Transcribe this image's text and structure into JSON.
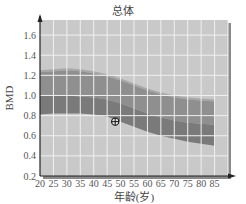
{
  "chart_data": {
    "type": "area",
    "title": "总体",
    "xlabel": "年龄(岁)",
    "ylabel": "BMD",
    "x_ticks": [
      20,
      25,
      30,
      35,
      40,
      45,
      50,
      55,
      60,
      65,
      70,
      75,
      80,
      85
    ],
    "y_ticks": [
      0.2,
      0.4,
      0.6,
      0.8,
      1.0,
      1.2,
      1.4,
      1.6
    ],
    "xlim": [
      20,
      90
    ],
    "ylim": [
      0.2,
      1.75
    ],
    "grid": true,
    "x": [
      20,
      25,
      30,
      35,
      40,
      45,
      50,
      55,
      60,
      65,
      70,
      75,
      80,
      85
    ],
    "series": [
      {
        "name": "upper band top (+2SD)",
        "values": [
          1.23,
          1.24,
          1.25,
          1.24,
          1.22,
          1.19,
          1.15,
          1.1,
          1.05,
          1.01,
          0.98,
          0.96,
          0.95,
          0.94
        ]
      },
      {
        "name": "reference mean",
        "values": [
          1.0,
          1.0,
          1.0,
          0.99,
          0.98,
          0.96,
          0.92,
          0.87,
          0.82,
          0.78,
          0.75,
          0.73,
          0.72,
          0.71
        ]
      },
      {
        "name": "lower band bottom (-2SD)",
        "values": [
          0.81,
          0.82,
          0.82,
          0.82,
          0.81,
          0.79,
          0.74,
          0.69,
          0.64,
          0.6,
          0.57,
          0.54,
          0.52,
          0.5
        ]
      }
    ],
    "points": [
      {
        "label": "patient",
        "x": 48,
        "y": 0.74,
        "marker": "circle-plus"
      }
    ],
    "colors": {
      "plot_bg": "#c9c9c9",
      "band_upper": "#8f8f8f",
      "band_lower": "#7a7a7a",
      "band_edge": "#a7a7a7",
      "grid": "#f0f0f0",
      "shadow": "#8a8a8a",
      "axis": "#222222"
    }
  }
}
